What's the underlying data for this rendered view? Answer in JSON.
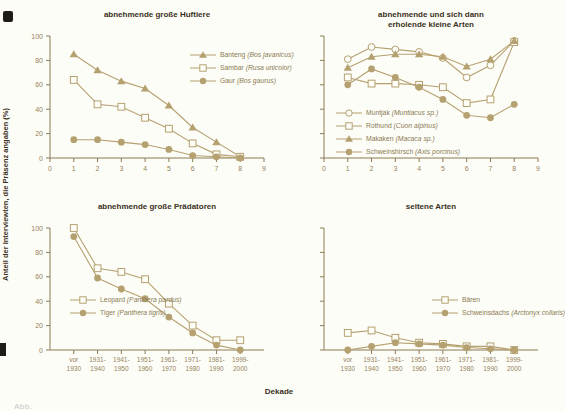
{
  "figure": {
    "ylabel": "Anteil der Interviewten, die Präsenz angaben (%)",
    "xlabel": "Dekade",
    "caption": "Abb.",
    "colors": {
      "line": "#b5a070",
      "marker_fill": "#b5a070",
      "open_fill": "#fdfdf8",
      "axis": "#8c7a55",
      "tick_text": "#95825a",
      "title_text": "#3a3021",
      "background": "#fdfdf8"
    }
  },
  "decade_labels": [
    [
      "vor",
      "1930"
    ],
    [
      "1931-",
      "1940"
    ],
    [
      "1941-",
      "1950"
    ],
    [
      "1951-",
      "1960"
    ],
    [
      "1961-",
      "1970"
    ],
    [
      "1971-",
      "1980"
    ],
    [
      "1981-",
      "1990"
    ],
    [
      "1999-",
      "2000"
    ]
  ],
  "chart_data": [
    {
      "type": "line",
      "title": "abnehmende große Huftiere",
      "title_lines": [
        "abnehmende große Huftiere"
      ],
      "x_label_mode": "numeric",
      "x_ticks": [
        0,
        1,
        2,
        3,
        4,
        5,
        6,
        7,
        8,
        9
      ],
      "y_ticks": [
        0,
        20,
        40,
        60,
        80,
        100
      ],
      "show_y_tick_labels": true,
      "ylim": [
        0,
        100
      ],
      "xlim": [
        0,
        9
      ],
      "grid": false,
      "x": [
        1,
        2,
        3,
        4,
        5,
        6,
        7,
        8
      ],
      "series": [
        {
          "name": "Banteng",
          "sci": "(Bos javanicus)",
          "marker": "triangle-filled",
          "values": [
            85,
            72,
            63,
            57,
            43,
            25,
            13,
            1
          ]
        },
        {
          "name": "Sambar",
          "sci": "(Rusa unicolor)",
          "marker": "square-open",
          "values": [
            64,
            44,
            42,
            33,
            24,
            12,
            3,
            1
          ]
        },
        {
          "name": "Gaur",
          "sci": "(Bos gaurus)",
          "marker": "circle-filled",
          "values": [
            15,
            15,
            13,
            11,
            7,
            2,
            1,
            0
          ]
        }
      ],
      "legend_pos": {
        "left": 178,
        "top": 42
      }
    },
    {
      "type": "line",
      "title": "abnehmende und sich dann erholende kleine Arten",
      "title_lines": [
        "abnehmende und sich dann",
        "erholende kleine Arten"
      ],
      "x_label_mode": "numeric",
      "x_ticks": [
        0,
        1,
        2,
        3,
        4,
        5,
        6,
        7,
        8,
        9
      ],
      "y_ticks": [
        0,
        20,
        40,
        60,
        80,
        100
      ],
      "show_y_tick_labels": false,
      "ylim": [
        0,
        100
      ],
      "xlim": [
        0,
        9
      ],
      "grid": false,
      "x": [
        1,
        2,
        3,
        4,
        5,
        6,
        7,
        8
      ],
      "series": [
        {
          "name": "Muntjak",
          "sci": "(Muntiacus sp.)",
          "marker": "circle-open",
          "values": [
            81,
            91,
            89,
            87,
            82,
            66,
            76,
            96
          ]
        },
        {
          "name": "Rothund",
          "sci": "(Cuon alpinus)",
          "marker": "square-open",
          "values": [
            66,
            61,
            61,
            60,
            58,
            45,
            48,
            95
          ]
        },
        {
          "name": "Makaken",
          "sci": "(Macaca sp.)",
          "marker": "triangle-filled",
          "values": [
            74,
            83,
            85,
            85,
            83,
            75,
            81,
            96
          ]
        },
        {
          "name": "Schweinshirsch",
          "sci": "(Axis porcinus)",
          "marker": "circle-filled",
          "values": [
            60,
            73,
            66,
            58,
            48,
            35,
            33,
            44
          ]
        }
      ],
      "legend_pos": {
        "left": 50,
        "top": 100
      }
    },
    {
      "type": "line",
      "title": "abnehmende große Prädatoren",
      "title_lines": [
        "abnehmende große Prädatoren"
      ],
      "x_label_mode": "decades",
      "y_ticks": [
        0,
        20,
        40,
        60,
        80,
        100
      ],
      "show_y_tick_labels": true,
      "ylim": [
        0,
        100
      ],
      "xlim": [
        0,
        9
      ],
      "grid": false,
      "x": [
        1,
        2,
        3,
        4,
        5,
        6,
        7,
        8
      ],
      "series": [
        {
          "name": "Leopard",
          "sci": "(Panthera pardus)",
          "marker": "square-open",
          "values": [
            100,
            67,
            64,
            58,
            38,
            20,
            8,
            8
          ]
        },
        {
          "name": "Tiger",
          "sci": "(Panthera tigris)",
          "marker": "circle-filled",
          "values": [
            93,
            59,
            50,
            42,
            27,
            14,
            4,
            0
          ]
        }
      ],
      "legend_pos": {
        "left": 58,
        "top": 95
      }
    },
    {
      "type": "line",
      "title": "seltene Arten",
      "title_lines": [
        "seltene Arten"
      ],
      "x_label_mode": "decades",
      "y_ticks": [
        0,
        20,
        40,
        60,
        80,
        100
      ],
      "show_y_tick_labels": false,
      "ylim": [
        0,
        100
      ],
      "xlim": [
        0,
        9
      ],
      "grid": false,
      "x": [
        1,
        2,
        3,
        4,
        5,
        6,
        7,
        8
      ],
      "series": [
        {
          "name": "Bären",
          "sci": "",
          "marker": "square-open",
          "values": [
            14,
            16,
            10,
            6,
            5,
            3,
            3,
            0
          ]
        },
        {
          "name": "Schweinsdachs",
          "sci": "(Arctonyx collaris)",
          "marker": "circle-filled",
          "values": [
            0,
            3,
            6,
            5,
            4,
            2,
            1,
            0
          ]
        }
      ],
      "legend_pos": {
        "left": 146,
        "top": 95
      }
    }
  ]
}
